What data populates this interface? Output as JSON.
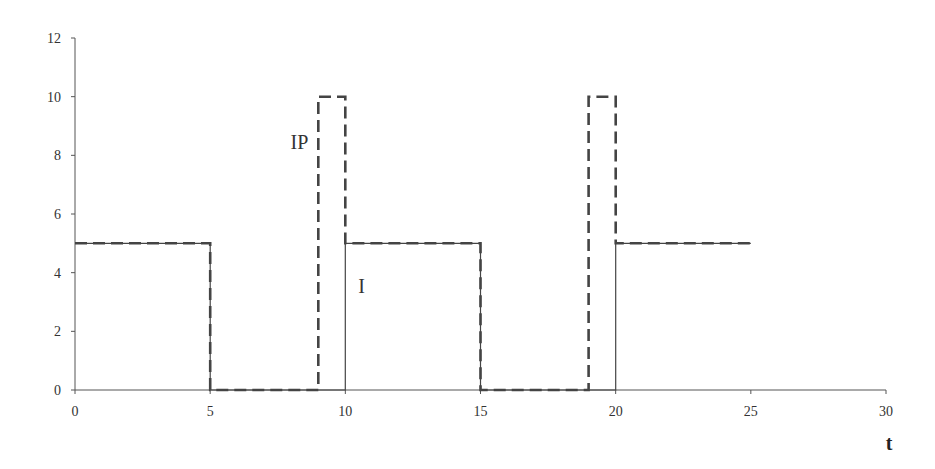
{
  "chart_data": {
    "type": "line",
    "title": "",
    "xlabel": "t",
    "ylabel": "",
    "xlim": [
      0,
      30
    ],
    "ylim": [
      0,
      12
    ],
    "x_ticks": [
      0,
      5,
      10,
      15,
      20,
      25,
      30
    ],
    "y_ticks": [
      0,
      2,
      4,
      6,
      8,
      10,
      12
    ],
    "grid": false,
    "legend": "none (inline labels)",
    "series": [
      {
        "name": "I",
        "style": "solid",
        "points": [
          [
            0,
            5
          ],
          [
            5,
            5
          ],
          [
            5,
            0
          ],
          [
            10,
            0
          ],
          [
            10,
            5
          ],
          [
            15,
            5
          ],
          [
            15,
            0
          ],
          [
            20,
            0
          ],
          [
            20,
            5
          ],
          [
            25,
            5
          ]
        ]
      },
      {
        "name": "IP",
        "style": "dashed",
        "points": [
          [
            0,
            5
          ],
          [
            5,
            5
          ],
          [
            5,
            0
          ],
          [
            9,
            0
          ],
          [
            9,
            10
          ],
          [
            10,
            10
          ],
          [
            10,
            5
          ],
          [
            15,
            5
          ],
          [
            15,
            0
          ],
          [
            19,
            0
          ],
          [
            19,
            10
          ],
          [
            20,
            10
          ],
          [
            20,
            5
          ],
          [
            25,
            5
          ]
        ]
      }
    ],
    "annotations": [
      {
        "text": "IP",
        "x": 8.3,
        "y": 8.2
      },
      {
        "text": "I",
        "x": 10.6,
        "y": 3.3
      }
    ]
  },
  "colors": {
    "axis": "#555555",
    "solid_line": "#444444",
    "dashed_line": "#444444"
  }
}
